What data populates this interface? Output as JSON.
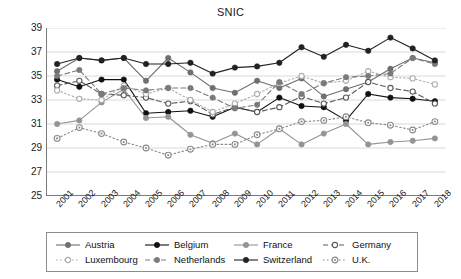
{
  "chart_data": {
    "type": "line",
    "title": "SNIC",
    "xlabel": "",
    "ylabel": "",
    "grid": true,
    "legend_position": "bottom",
    "ylim": [
      25,
      39
    ],
    "yticks": [
      25,
      27,
      29,
      31,
      33,
      35,
      37,
      39
    ],
    "categories": [
      "2001",
      "2002",
      "2003",
      "2004",
      "2005",
      "2006",
      "2007",
      "2008",
      "2009",
      "2010",
      "2011",
      "2012",
      "2013",
      "2014",
      "2015",
      "2016",
      "2017",
      "2018"
    ],
    "series": [
      {
        "name": "Austria",
        "color": "#6f6f6f",
        "line_style": "solid",
        "marker": "filled-circle",
        "values": [
          35.4,
          36.5,
          36.3,
          36.5,
          34.6,
          36.5,
          35.3,
          34.0,
          33.6,
          34.6,
          34.0,
          34.8,
          33.3,
          33.9,
          34.5,
          35.6,
          36.5,
          36.1
        ]
      },
      {
        "name": "Belgium",
        "color": "#111111",
        "line_style": "solid",
        "marker": "filled-circle",
        "values": [
          34.7,
          34.1,
          34.7,
          34.7,
          31.9,
          32.0,
          32.1,
          31.6,
          32.4,
          32.0,
          33.2,
          32.5,
          32.4,
          31.3,
          33.5,
          33.2,
          33.1,
          32.9
        ]
      },
      {
        "name": "France",
        "color": "#949494",
        "line_style": "solid",
        "marker": "filled-circle",
        "values": [
          31.0,
          31.3,
          32.8,
          33.9,
          31.5,
          31.6,
          30.1,
          29.4,
          30.2,
          29.3,
          30.6,
          29.3,
          30.2,
          31.0,
          29.3,
          29.5,
          29.6,
          29.8
        ]
      },
      {
        "name": "Germany",
        "color": "#5a5a5a",
        "line_style": "dashed",
        "marker": "open-circle",
        "values": [
          34.2,
          34.6,
          33.5,
          33.4,
          33.2,
          32.7,
          32.9,
          31.8,
          32.4,
          32.0,
          32.4,
          33.3,
          32.7,
          33.2,
          34.5,
          34.0,
          33.7,
          32.7
        ]
      },
      {
        "name": "Luxembourg",
        "color": "#adadad",
        "line_style": "dotted",
        "marker": "open-circle",
        "values": [
          33.8,
          33.1,
          33.0,
          34.2,
          33.5,
          34.0,
          33.0,
          32.0,
          32.7,
          33.5,
          34.4,
          35.0,
          34.4,
          34.6,
          35.4,
          34.9,
          34.8,
          34.3
        ]
      },
      {
        "name": "Netherlands",
        "color": "#7a7a7a",
        "line_style": "dashed",
        "marker": "filled-circle",
        "values": [
          35.0,
          35.5,
          33.5,
          34.0,
          33.8,
          34.0,
          34.0,
          33.2,
          32.3,
          32.6,
          34.5,
          33.5,
          34.4,
          34.9,
          35.0,
          35.2,
          36.5,
          36.0
        ]
      },
      {
        "name": "Switzerland",
        "color": "#222222",
        "line_style": "solid",
        "marker": "filled-circle",
        "values": [
          36.0,
          36.5,
          36.3,
          36.5,
          36.0,
          36.0,
          36.1,
          35.2,
          35.7,
          35.8,
          36.1,
          37.4,
          36.6,
          37.6,
          37.1,
          38.2,
          37.3,
          36.3
        ]
      },
      {
        "name": "U.K.",
        "color": "#8a8a8a",
        "line_style": "dotted",
        "marker": "open-circle-dot",
        "values": [
          29.8,
          30.7,
          30.2,
          29.5,
          29.0,
          28.4,
          28.9,
          29.3,
          29.3,
          30.1,
          30.6,
          31.2,
          31.3,
          31.6,
          31.1,
          30.9,
          30.5,
          31.2
        ]
      }
    ]
  },
  "legend": {
    "items": [
      {
        "label": "Austria",
        "marker": "filled-circle",
        "line_style": "solid",
        "color": "#6f6f6f"
      },
      {
        "label": "Belgium",
        "marker": "filled-circle",
        "line_style": "solid",
        "color": "#111111"
      },
      {
        "label": "France",
        "marker": "filled-circle",
        "line_style": "solid",
        "color": "#949494"
      },
      {
        "label": "Germany",
        "marker": "open-circle",
        "line_style": "dashed",
        "color": "#5a5a5a"
      },
      {
        "label": "Luxembourg",
        "marker": "open-circle",
        "line_style": "dotted",
        "color": "#adadad"
      },
      {
        "label": "Netherlands",
        "marker": "filled-circle",
        "line_style": "dashed",
        "color": "#7a7a7a"
      },
      {
        "label": "Switzerland",
        "marker": "filled-circle",
        "line_style": "solid",
        "color": "#222222"
      },
      {
        "label": "U.K.",
        "marker": "open-circle-dot",
        "line_style": "dotted",
        "color": "#8a8a8a"
      }
    ]
  },
  "axis": {
    "line_color": "#7b7b7b",
    "grid_color": "#d9d9d9"
  }
}
